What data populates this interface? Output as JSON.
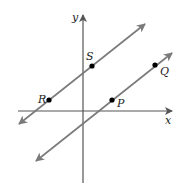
{
  "diagram": {
    "title": "",
    "axes": {
      "x_label": "x",
      "y_label": "y",
      "origin": [
        83,
        111
      ],
      "x_axis": {
        "x1": 18,
        "x2": 172,
        "y": 111
      },
      "y_axis": {
        "x": 83,
        "y1": 15,
        "y2": 183
      },
      "color": "#555555"
    },
    "lines": [
      {
        "name": "line-RS",
        "x1": 19,
        "y1": 124,
        "x2": 145,
        "y2": 24,
        "color": "#7a7a7a",
        "through": [
          "R",
          "S"
        ]
      },
      {
        "name": "line-PQ",
        "x1": 36,
        "y1": 161,
        "x2": 172,
        "y2": 53,
        "color": "#7a7a7a",
        "through": [
          "P",
          "Q"
        ]
      }
    ],
    "points": [
      {
        "label": "S",
        "x": 92,
        "y": 66,
        "lx": 86,
        "ly": 60
      },
      {
        "label": "Q",
        "x": 155,
        "y": 65,
        "lx": 160,
        "ly": 75
      },
      {
        "label": "R",
        "x": 49,
        "y": 100,
        "lx": 38,
        "ly": 103
      },
      {
        "label": "P",
        "x": 112,
        "y": 100,
        "lx": 117,
        "ly": 107
      }
    ],
    "point_color": "#000000"
  }
}
